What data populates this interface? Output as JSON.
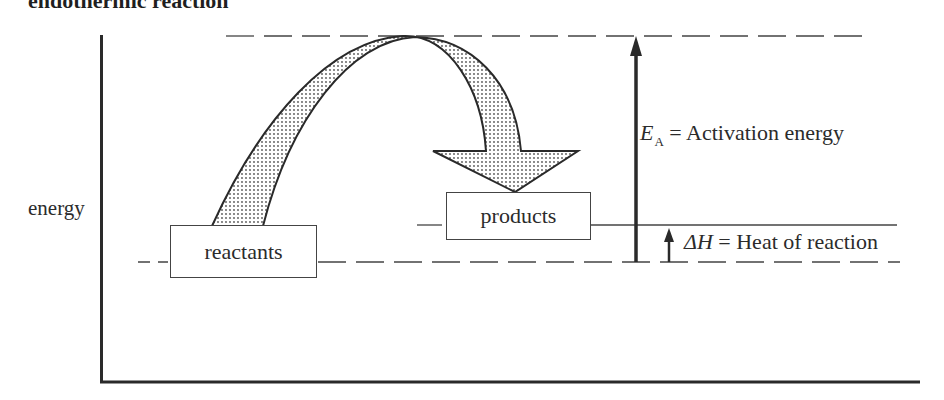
{
  "title": "endothermic reaction",
  "axis": {
    "y_label": "energy"
  },
  "boxes": {
    "reactants": "reactants",
    "products": "products"
  },
  "annotations": {
    "activation": {
      "symbol": "E",
      "subscript": "A",
      "equals": "=",
      "text": "Activation energy"
    },
    "heat": {
      "symbol": "ΔH",
      "equals": "=",
      "text": "Heat of reaction"
    }
  },
  "levels": {
    "reactant_level_y": 262,
    "product_level_y": 225,
    "transition_state_y": 36
  },
  "colors": {
    "line": "#2a2a2a",
    "shade_dot": "#555555",
    "background": "#ffffff"
  }
}
